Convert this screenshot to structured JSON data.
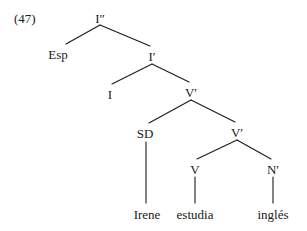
{
  "figure": {
    "example_number": "(47)",
    "sentence": "Irene estudia inglés",
    "ink_color": "#1a1a1a",
    "background_color": "#ffffff"
  },
  "tree": {
    "nodes": [
      {
        "id": "Ibar2",
        "label": "I″",
        "x": 100,
        "y": 12,
        "kind": "phrase"
      },
      {
        "id": "Esp",
        "label": "Esp",
        "x": 58,
        "y": 48,
        "kind": "phrase"
      },
      {
        "id": "Ibar1",
        "label": "I′",
        "x": 152,
        "y": 50,
        "kind": "phrase"
      },
      {
        "id": "I",
        "label": "I",
        "x": 110,
        "y": 88,
        "kind": "head"
      },
      {
        "id": "Vbar1",
        "label": "V′",
        "x": 191,
        "y": 86,
        "kind": "phrase"
      },
      {
        "id": "SD",
        "label": "SD",
        "x": 145,
        "y": 127,
        "kind": "phrase"
      },
      {
        "id": "Vbar2",
        "label": "V′",
        "x": 237,
        "y": 126,
        "kind": "phrase"
      },
      {
        "id": "V",
        "label": "V",
        "x": 195,
        "y": 163,
        "kind": "head"
      },
      {
        "id": "Nbar",
        "label": "N′",
        "x": 273,
        "y": 163,
        "kind": "phrase"
      }
    ],
    "terminals": [
      {
        "id": "w-irene",
        "label": "Irene",
        "x": 147,
        "y": 208,
        "parent": "SD"
      },
      {
        "id": "w-estudia",
        "label": "estudia",
        "x": 195,
        "y": 208,
        "parent": "V"
      },
      {
        "id": "w-ingles",
        "label": "inglés",
        "x": 273,
        "y": 208,
        "parent": "Nbar"
      }
    ],
    "branches": [
      {
        "from": "Ibar2",
        "to": "Esp",
        "x1": 100,
        "y1": 25,
        "x2": 66,
        "y2": 44
      },
      {
        "from": "Ibar2",
        "to": "Ibar1",
        "x1": 100,
        "y1": 25,
        "x2": 150,
        "y2": 46
      },
      {
        "from": "Ibar1",
        "to": "I",
        "x1": 152,
        "y1": 64,
        "x2": 112,
        "y2": 84
      },
      {
        "from": "Ibar1",
        "to": "Vbar1",
        "x1": 152,
        "y1": 64,
        "x2": 189,
        "y2": 82
      },
      {
        "from": "Vbar1",
        "to": "SD",
        "x1": 191,
        "y1": 100,
        "x2": 149,
        "y2": 123
      },
      {
        "from": "Vbar1",
        "to": "Vbar2",
        "x1": 191,
        "y1": 100,
        "x2": 235,
        "y2": 122
      },
      {
        "from": "Vbar2",
        "to": "V",
        "x1": 237,
        "y1": 140,
        "x2": 197,
        "y2": 159
      },
      {
        "from": "Vbar2",
        "to": "Nbar",
        "x1": 237,
        "y1": 140,
        "x2": 271,
        "y2": 159
      },
      {
        "from": "SD",
        "to": "w-irene",
        "x1": 146,
        "y1": 142,
        "x2": 146,
        "y2": 203
      },
      {
        "from": "V",
        "to": "w-estudia",
        "x1": 195,
        "y1": 177,
        "x2": 195,
        "y2": 203
      },
      {
        "from": "Nbar",
        "to": "w-ingles",
        "x1": 273,
        "y1": 177,
        "x2": 273,
        "y2": 203
      }
    ]
  }
}
